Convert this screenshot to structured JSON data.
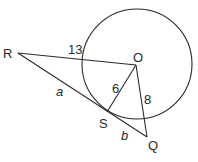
{
  "diagram": {
    "type": "geometry",
    "points": {
      "R": {
        "label": "R",
        "x": 18,
        "y": 53
      },
      "O": {
        "label": "O",
        "x": 136,
        "y": 65
      },
      "S": {
        "label": "S",
        "x": 107,
        "y": 112
      },
      "Q": {
        "label": "Q",
        "x": 147,
        "y": 137
      }
    },
    "circle": {
      "center": "O",
      "cx": 137,
      "cy": 64,
      "r": 55
    },
    "segments": [
      {
        "from": "R",
        "to": "O",
        "label": "13"
      },
      {
        "from": "O",
        "to": "S",
        "label": "6"
      },
      {
        "from": "O",
        "to": "Q",
        "label": "8"
      },
      {
        "from": "R",
        "to": "S",
        "label": "a"
      },
      {
        "from": "S",
        "to": "Q",
        "label": "b"
      }
    ],
    "labels": {
      "R": "R",
      "O": "O",
      "S": "S",
      "Q": "Q",
      "RO": "13",
      "OS": "6",
      "OQ": "8",
      "RS": "a",
      "SQ": "b"
    }
  }
}
